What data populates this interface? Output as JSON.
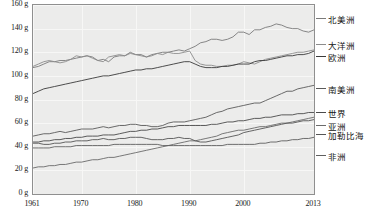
{
  "chart_data": {
    "type": "line",
    "title": "",
    "xlabel": "",
    "ylabel": "",
    "unit": "g",
    "xlim": [
      1961,
      2013
    ],
    "ylim": [
      0,
      160
    ],
    "y_ticks": [
      0,
      20,
      40,
      60,
      80,
      100,
      120,
      140,
      160
    ],
    "y_tick_labels": [
      "0 g",
      "20 g",
      "40 g",
      "60 g",
      "80 g",
      "100 g",
      "120 g",
      "140 g",
      "160 g"
    ],
    "x_ticks": [
      1961,
      1970,
      1980,
      1990,
      2000,
      2013
    ],
    "x_tick_labels": [
      "1961",
      "1970",
      "1980",
      "1990",
      "2000",
      "2013"
    ],
    "grid": true,
    "legend_position": "right",
    "x": [
      1961,
      1962,
      1963,
      1964,
      1965,
      1966,
      1967,
      1968,
      1969,
      1970,
      1971,
      1972,
      1973,
      1974,
      1975,
      1976,
      1977,
      1978,
      1979,
      1980,
      1981,
      1982,
      1983,
      1984,
      1985,
      1986,
      1987,
      1988,
      1989,
      1990,
      1991,
      1992,
      1993,
      1994,
      1995,
      1996,
      1997,
      1998,
      1999,
      2000,
      2001,
      2002,
      2003,
      2004,
      2005,
      2006,
      2007,
      2008,
      2009,
      2010,
      2011,
      2012,
      2013
    ],
    "series": [
      {
        "name": "北美洲",
        "color": "#7a7a7a",
        "label_y": 18,
        "values": [
          107,
          108,
          110,
          112,
          112,
          113,
          113,
          114,
          115,
          116,
          117,
          116,
          113,
          114,
          112,
          116,
          117,
          117,
          120,
          118,
          118,
          116,
          118,
          119,
          120,
          120,
          121,
          122,
          121,
          123,
          125,
          128,
          129,
          131,
          131,
          130,
          131,
          133,
          137,
          137,
          135,
          139,
          139,
          141,
          142,
          144,
          143,
          141,
          140,
          140,
          138,
          137,
          139
        ]
      },
      {
        "name": "大洋洲",
        "color": "#8c8c8c",
        "label_y": 44,
        "values": [
          108,
          110,
          112,
          113,
          112,
          111,
          112,
          114,
          117,
          116,
          117,
          115,
          113,
          112,
          116,
          117,
          118,
          117,
          119,
          118,
          117,
          116,
          117,
          119,
          118,
          120,
          119,
          119,
          120,
          121,
          113,
          110,
          109,
          109,
          108,
          108,
          109,
          109,
          110,
          112,
          111,
          110,
          112,
          114,
          115,
          116,
          117,
          118,
          119,
          120,
          120,
          121,
          122
        ]
      },
      {
        "name": "欧洲",
        "color": "#3a3a3a",
        "label_y": 56,
        "values": [
          85,
          87,
          89,
          90,
          91,
          92,
          93,
          94,
          95,
          96,
          97,
          98,
          99,
          100,
          100,
          101,
          102,
          103,
          104,
          105,
          105,
          106,
          106,
          107,
          108,
          109,
          110,
          111,
          112,
          112,
          110,
          108,
          107,
          107,
          107,
          108,
          108,
          109,
          110,
          110,
          110,
          112,
          113,
          113,
          114,
          115,
          116,
          117,
          117,
          118,
          118,
          119,
          121
        ]
      },
      {
        "name": "南美洲",
        "color": "#5a5a5a",
        "label_y": 88,
        "values": [
          49,
          50,
          51,
          51,
          52,
          53,
          52,
          53,
          54,
          55,
          55,
          55,
          56,
          57,
          56,
          57,
          58,
          58,
          59,
          59,
          58,
          58,
          57,
          57,
          58,
          60,
          61,
          61,
          61,
          62,
          63,
          64,
          65,
          67,
          69,
          70,
          72,
          73,
          74,
          75,
          76,
          77,
          77,
          79,
          81,
          83,
          85,
          87,
          87,
          89,
          90,
          91,
          92
        ]
      },
      {
        "name": "世界",
        "color": "#4a4a4a",
        "label_y": 112,
        "values": [
          44,
          44,
          45,
          45,
          46,
          46,
          47,
          47,
          48,
          48,
          49,
          49,
          49,
          50,
          50,
          50,
          51,
          52,
          53,
          53,
          54,
          54,
          55,
          55,
          56,
          57,
          57,
          58,
          58,
          58,
          58,
          58,
          58,
          59,
          59,
          60,
          61,
          61,
          62,
          62,
          63,
          64,
          64,
          65,
          65,
          66,
          67,
          67,
          67,
          68,
          68,
          69,
          69
        ]
      },
      {
        "name": "亚洲",
        "color": "#6a6a6a",
        "label_y": 125,
        "values": [
          22,
          23,
          23,
          24,
          24,
          25,
          25,
          26,
          27,
          27,
          28,
          29,
          29,
          30,
          31,
          31,
          32,
          33,
          34,
          35,
          36,
          37,
          38,
          39,
          40,
          41,
          42,
          43,
          44,
          45,
          45,
          46,
          47,
          48,
          49,
          51,
          52,
          53,
          54,
          54,
          55,
          56,
          57,
          57,
          58,
          59,
          60,
          60,
          61,
          62,
          63,
          64,
          65
        ]
      },
      {
        "name": "加勒比海",
        "color": "#555555",
        "label_y": 134,
        "values": [
          43,
          43,
          42,
          42,
          43,
          43,
          44,
          44,
          45,
          45,
          45,
          46,
          46,
          47,
          46,
          46,
          47,
          47,
          48,
          48,
          48,
          47,
          46,
          46,
          46,
          47,
          47,
          48,
          47,
          47,
          45,
          44,
          44,
          45,
          46,
          47,
          48,
          49,
          50,
          52,
          53,
          54,
          55,
          56,
          57,
          58,
          59,
          60,
          60,
          61,
          62,
          62,
          63
        ]
      },
      {
        "name": "非洲",
        "color": "#5f5f5f",
        "label_y": 155,
        "values": [
          39,
          39,
          39,
          39,
          40,
          40,
          40,
          40,
          41,
          41,
          41,
          41,
          41,
          41,
          41,
          42,
          42,
          42,
          42,
          42,
          42,
          42,
          42,
          42,
          41,
          41,
          41,
          41,
          41,
          41,
          41,
          41,
          41,
          41,
          41,
          41,
          42,
          42,
          42,
          42,
          42,
          42,
          43,
          43,
          44,
          44,
          45,
          45,
          46,
          46,
          47,
          47,
          48
        ]
      }
    ]
  }
}
